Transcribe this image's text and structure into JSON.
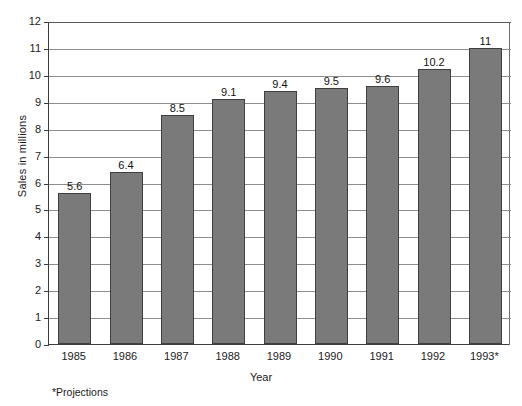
{
  "chart_data": {
    "type": "bar",
    "title": "",
    "xlabel": "Year",
    "ylabel": "Sales in millions",
    "categories": [
      "1985",
      "1986",
      "1987",
      "1988",
      "1989",
      "1990",
      "1991",
      "1992",
      "1993*"
    ],
    "values": [
      5.6,
      6.4,
      8.5,
      9.1,
      9.4,
      9.5,
      9.6,
      10.2,
      11
    ],
    "value_labels": [
      "5.6",
      "6.4",
      "8.5",
      "9.1",
      "9.4",
      "9.5",
      "9.6",
      "10.2",
      "11"
    ],
    "ylim": [
      0,
      12
    ],
    "ytick_labels": [
      "0",
      "1",
      "2",
      "3",
      "4",
      "5",
      "6",
      "7",
      "8",
      "9",
      "10",
      "11",
      "12"
    ],
    "ytick_values": [
      0,
      1,
      2,
      3,
      4,
      5,
      6,
      7,
      8,
      9,
      10,
      11,
      12
    ],
    "grid": true,
    "legend": "none",
    "bar_color": "#7a7a7a",
    "bar_border_color": "#3f3f3f",
    "axis_color": "#3c3c3c",
    "grid_color": "#8d8d8d",
    "background": "#ffffff"
  },
  "footnote": "*Projections"
}
